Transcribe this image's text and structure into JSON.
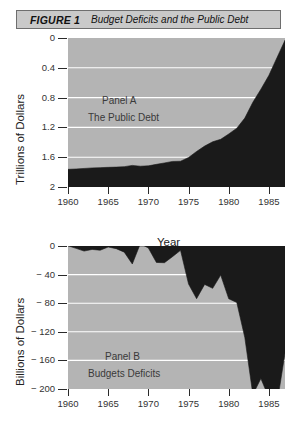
{
  "figure": {
    "label": "FIGURE 1",
    "title": "Budget Deficits and the Public Debt"
  },
  "panel_a": {
    "annotation_line1": "Panel A",
    "annotation_line2": "The Public Debt",
    "ylabel": "Trillions of Dollars",
    "xlabel": "Year",
    "yticks": [
      "2",
      "1.6",
      "1.2",
      "0.8",
      "0.4",
      "0"
    ],
    "xticks": [
      "1960",
      "1965",
      "1970",
      "1975",
      "1980",
      "1985"
    ]
  },
  "panel_b": {
    "annotation_line1": "Panel B",
    "annotation_line2": "Budgets Deficits",
    "ylabel": "Billions of Dollars",
    "xlabel": "Year",
    "yticks": [
      "0",
      "− 40",
      "− 80",
      "− 120",
      "− 160",
      "− 200"
    ],
    "xticks": [
      "1960",
      "1965",
      "1970",
      "1975",
      "1980",
      "1985"
    ]
  },
  "colors": {
    "plot_background": "#b4b4b4",
    "area_fill": "#1a1a1a",
    "gridline": "#ffffff",
    "title_bar": "#c9c9c9",
    "title_border": "#6e6e6e",
    "axis": "#2a2a2a"
  },
  "chart_data": [
    {
      "type": "area",
      "id": "panel-a",
      "title": "Panel A  The Public Debt",
      "xlabel": "Year",
      "ylabel": "Trillions of Dollars",
      "xlim": [
        1960,
        1987
      ],
      "ylim": [
        0,
        2
      ],
      "yticks": [
        0,
        0.4,
        0.8,
        1.2,
        1.6,
        2
      ],
      "xticks": [
        1960,
        1965,
        1970,
        1975,
        1980,
        1985
      ],
      "grid": true,
      "legend": null,
      "x": [
        1960,
        1961,
        1962,
        1963,
        1964,
        1965,
        1966,
        1967,
        1968,
        1969,
        1970,
        1971,
        1972,
        1973,
        1974,
        1975,
        1976,
        1977,
        1978,
        1979,
        1980,
        1981,
        1982,
        1983,
        1984,
        1985,
        1986,
        1987
      ],
      "values": [
        0.237,
        0.242,
        0.249,
        0.256,
        0.26,
        0.264,
        0.267,
        0.273,
        0.29,
        0.279,
        0.284,
        0.304,
        0.323,
        0.343,
        0.346,
        0.396,
        0.477,
        0.549,
        0.607,
        0.64,
        0.712,
        0.789,
        0.925,
        1.137,
        1.312,
        1.499,
        1.736,
        1.97
      ]
    },
    {
      "type": "area",
      "id": "panel-b",
      "title": "Panel B  Budgets Deficits",
      "xlabel": "Year",
      "ylabel": "Billions of Dollars",
      "xlim": [
        1960,
        1987
      ],
      "ylim": [
        -200,
        0
      ],
      "yticks": [
        0,
        -40,
        -80,
        -120,
        -160,
        -200
      ],
      "xticks": [
        1960,
        1965,
        1970,
        1975,
        1980,
        1985
      ],
      "grid": true,
      "legend": null,
      "x": [
        1960,
        1961,
        1962,
        1963,
        1964,
        1965,
        1966,
        1967,
        1968,
        1969,
        1970,
        1971,
        1972,
        1973,
        1974,
        1975,
        1976,
        1977,
        1978,
        1979,
        1980,
        1981,
        1982,
        1983,
        1984,
        1985,
        1986,
        1987
      ],
      "values": [
        0.3,
        -3.3,
        -7.1,
        -4.8,
        -5.9,
        -1.4,
        -3.7,
        -8.6,
        -25.2,
        3.2,
        -2.8,
        -23.0,
        -23.4,
        -14.9,
        -6.1,
        -53.2,
        -73.7,
        -53.7,
        -59.2,
        -40.7,
        -73.8,
        -79.0,
        -128.0,
        -207.8,
        -185.4,
        -212.3,
        -221.2,
        -150.0
      ]
    }
  ]
}
